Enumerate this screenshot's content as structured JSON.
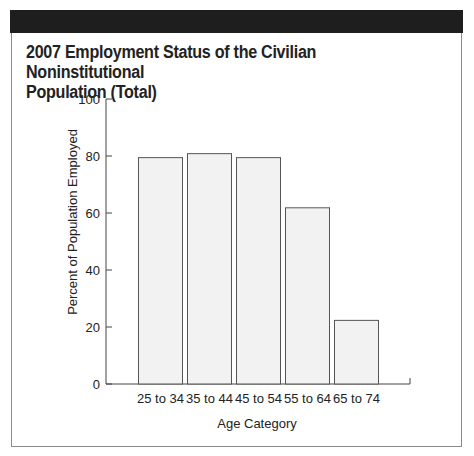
{
  "title_line1": "2007 Employment Status of the Civilian Noninstitutional",
  "title_line2": "Population (Total)",
  "colors": {
    "header_bar": "#1e1e1e",
    "bar_fill": "#f2f2f2",
    "bar_stroke": "#555555",
    "axis": "#444444",
    "frame": "#8a8a8a"
  },
  "chart_data": {
    "type": "bar",
    "title": "2007 Employment Status of the Civilian Noninstitutional Population (Total)",
    "categories": [
      "25 to 34",
      "35 to 44",
      "45 to 54",
      "55 to 64",
      "65 to 74"
    ],
    "values": [
      79.6,
      81,
      79.6,
      62,
      22.5
    ],
    "xlabel": "Age Category",
    "ylabel": "Percent of Population Employed",
    "ylim": [
      0,
      100
    ],
    "yticks": [
      0,
      20,
      40,
      60,
      80,
      100
    ],
    "grid": false,
    "legend": null
  }
}
